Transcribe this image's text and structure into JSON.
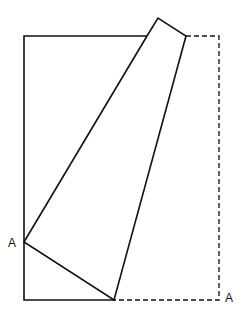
{
  "diagram": {
    "type": "paper-fold",
    "labels": [
      {
        "id": "left",
        "text": "A"
      },
      {
        "id": "corner",
        "text": "A"
      }
    ],
    "stroke_color": "#111111",
    "background": "#ffffff",
    "shapes": {
      "rectangle_solid": [
        [
          147,
          36
        ],
        [
          24,
          36
        ],
        [
          24,
          300
        ],
        [
          114,
          300
        ]
      ],
      "rectangle_dashed": [
        [
          186,
          36
        ],
        [
          219,
          36
        ],
        [
          219,
          300
        ],
        [
          114,
          300
        ]
      ],
      "folded_flap": [
        [
          24,
          242
        ],
        [
          147,
          36
        ],
        [
          158,
          18
        ],
        [
          186,
          36
        ],
        [
          114,
          300
        ]
      ]
    }
  }
}
